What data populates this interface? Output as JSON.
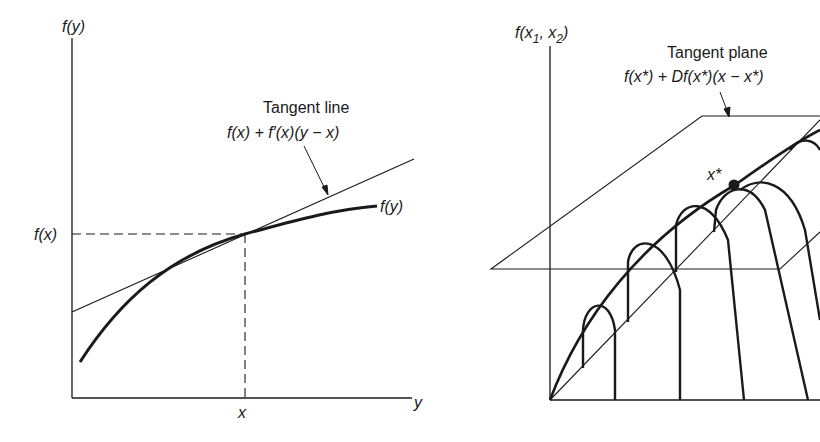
{
  "left_figure": {
    "y_axis_label": "f(y)",
    "x_axis_label": "y",
    "x_tick_label": "x",
    "y_tick_label": "f(x)",
    "curve_label": "f(y)",
    "tangent_title": "Tangent line",
    "tangent_formula": "f(x) + f′(x)(y − x)"
  },
  "right_figure": {
    "z_axis_label_main": "f(x",
    "z_axis_sub1": "1",
    "z_axis_sep": ", x",
    "z_axis_sub2": "2",
    "z_axis_close": ")",
    "tangent_title": "Tangent plane",
    "tangent_formula": "f(x*) + Df(x*)(x − x*)",
    "point_label": "x*"
  },
  "colors": {
    "ink": "#1a1a1a",
    "background": "#ffffff"
  }
}
